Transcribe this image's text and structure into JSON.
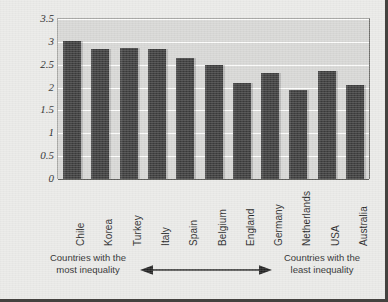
{
  "chart_data": {
    "type": "bar",
    "title": "",
    "subtitle": "",
    "xlabel": "",
    "ylabel": "Hostile sexism scores",
    "ylim": [
      0,
      3.5
    ],
    "yticks": [
      "0",
      "0.5",
      "1",
      "1.5",
      "2",
      "2.5",
      "3",
      "3.5"
    ],
    "ytick_values": [
      0,
      0.5,
      1,
      1.5,
      2,
      2.5,
      3,
      3.5
    ],
    "grid": true,
    "legend": "none",
    "categories": [
      "Chile",
      "Korea",
      "Turkey",
      "Italy",
      "Spain",
      "Belgium",
      "England",
      "Germany",
      "Netherlands",
      "USA",
      "Australia"
    ],
    "values": [
      3.02,
      2.85,
      2.87,
      2.84,
      2.65,
      2.5,
      2.11,
      2.33,
      1.95,
      2.36,
      2.05
    ],
    "series": [
      {
        "name": "Hostile sexism scores",
        "values": [
          3.02,
          2.85,
          2.87,
          2.84,
          2.65,
          2.5,
          2.11,
          2.33,
          1.95,
          2.36,
          2.05
        ]
      }
    ],
    "annotations": [
      {
        "text": "Countries with the\nmost inequality",
        "position": "bottom-left"
      },
      {
        "text": "Countries with the\nleast inequality",
        "position": "bottom-right"
      },
      {
        "text": "double-headed-arrow",
        "position": "bottom-center"
      }
    ],
    "colors": {
      "bar": "#3b3b3b",
      "plot_background": "#d6d6d4",
      "figure_background": "#e9e9e7",
      "gridline": "#fdfdfc",
      "axis": "#5d5d5a",
      "text": "#1f1f1f",
      "border": "#44423f"
    }
  },
  "annotation": {
    "left_line1": "Countries with the",
    "left_line2": "most inequality",
    "right_line1": "Countries with the",
    "right_line2": "least inequality",
    "left_text": "Countries with the\nmost inequality",
    "right_text": "Countries with the\nleast inequality"
  }
}
